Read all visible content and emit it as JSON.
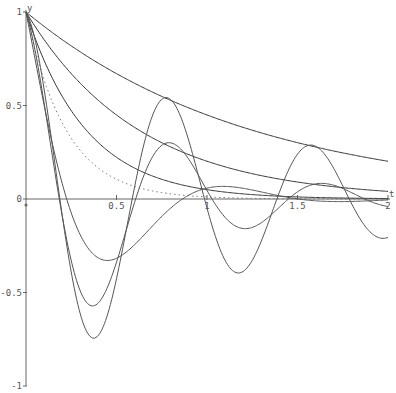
{
  "chart_data": {
    "type": "line",
    "title": "",
    "xlabel": "t",
    "ylabel": "y",
    "xlim": [
      0,
      2
    ],
    "ylim": [
      -1,
      1
    ],
    "grid": false,
    "legend": null,
    "x_ticks": [
      {
        "value": 0,
        "label": "0"
      },
      {
        "value": 0.5,
        "label": "0.5"
      },
      {
        "value": 1,
        "label": "1"
      },
      {
        "value": 1.5,
        "label": "1.5"
      },
      {
        "value": 2,
        "label": "2"
      }
    ],
    "y_ticks": [
      {
        "value": 1,
        "label": "1"
      },
      {
        "value": 0.5,
        "label": "0.5"
      },
      {
        "value": 0,
        "label": "0"
      },
      {
        "value": -0.5,
        "label": "-0.5"
      },
      {
        "value": -1,
        "label": "-1"
      }
    ],
    "x": [
      0,
      0.2,
      0.4,
      0.6,
      0.8,
      1.0,
      1.2,
      1.4,
      1.6,
      1.8,
      2.0
    ],
    "series": [
      {
        "name": "decay-1",
        "style": "solid",
        "kind": "exp",
        "rate": 0.8,
        "values": [
          1.0,
          0.85,
          0.73,
          0.62,
          0.53,
          0.45,
          0.38,
          0.33,
          0.28,
          0.24,
          0.2
        ]
      },
      {
        "name": "decay-2",
        "style": "solid",
        "kind": "exp",
        "rate": 1.6,
        "values": [
          1.0,
          0.73,
          0.53,
          0.38,
          0.28,
          0.2,
          0.15,
          0.11,
          0.08,
          0.06,
          0.04
        ]
      },
      {
        "name": "decay-3",
        "style": "solid",
        "kind": "exp",
        "rate": 3.0,
        "values": [
          1.0,
          0.55,
          0.3,
          0.17,
          0.09,
          0.05,
          0.03,
          0.02,
          0.01,
          0.0,
          0.0
        ]
      },
      {
        "name": "decay-dotted",
        "style": "dotted",
        "kind": "exp",
        "rate": 4.5,
        "values": [
          1.0,
          0.41,
          0.17,
          0.07,
          0.03,
          0.01,
          0.0,
          0.0,
          0.0,
          0.0,
          0.0
        ]
      },
      {
        "name": "osc-small",
        "style": "solid",
        "kind": "osc",
        "zeta": 0.45,
        "omega": 5.5,
        "values": [
          1.0,
          0.3,
          -0.12,
          -0.12,
          -0.02,
          0.03,
          0.02,
          0.01,
          0.0,
          0.0,
          0.0
        ]
      },
      {
        "name": "osc-medium",
        "style": "solid",
        "kind": "osc",
        "zeta": 0.2,
        "omega": 7.6,
        "values": [
          1.0,
          0.05,
          -0.43,
          -0.15,
          0.2,
          0.12,
          -0.06,
          -0.06,
          0.03,
          0.03,
          -0.01
        ]
      },
      {
        "name": "osc-large",
        "style": "solid",
        "kind": "osc",
        "zeta": 0.1,
        "omega": 7.9,
        "values": [
          1.0,
          -0.05,
          -0.66,
          -0.15,
          0.45,
          0.12,
          -0.3,
          -0.03,
          0.2,
          0.05,
          -0.13
        ]
      }
    ]
  }
}
